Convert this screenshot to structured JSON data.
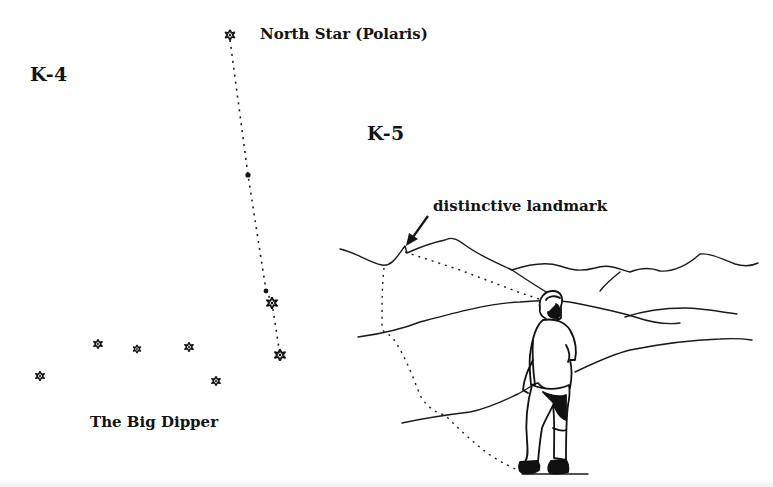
{
  "figures": {
    "k4": {
      "id_label": "K-4",
      "polaris_label": "North Star (Polaris)",
      "dipper_label": "The Big Dipper",
      "stars": [
        {
          "name": "polaris",
          "x": 230,
          "y": 35,
          "size": 5
        },
        {
          "name": "dipper-handle-end",
          "x": 40,
          "y": 376,
          "size": 4.5
        },
        {
          "name": "dipper-handle-2",
          "x": 98,
          "y": 344,
          "size": 4.5
        },
        {
          "name": "dipper-handle-3",
          "x": 137,
          "y": 349,
          "size": 4
        },
        {
          "name": "dipper-bowl-top-left",
          "x": 189,
          "y": 347,
          "size": 4.5
        },
        {
          "name": "dipper-bowl-bottom-left",
          "x": 216,
          "y": 381,
          "size": 4.5
        },
        {
          "name": "dipper-pointer-top",
          "x": 272,
          "y": 303,
          "size": 5.5
        },
        {
          "name": "dipper-pointer-bottom",
          "x": 280,
          "y": 355,
          "size": 5.5
        }
      ]
    },
    "k5": {
      "id_label": "K-5",
      "landmark_label": "distinctive landmark"
    }
  }
}
